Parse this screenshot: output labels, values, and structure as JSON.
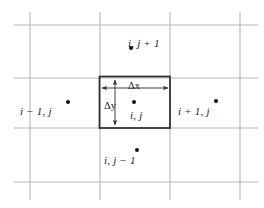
{
  "figure": {
    "background_color": "#ffffff",
    "grid_color": "#b4b4b4",
    "box_color": "#2b2b2b",
    "text_color": "#1a1a1a",
    "grid": {
      "vertical_lines_x": [
        30,
        100,
        170,
        240
      ],
      "horizontal_lines_y": [
        25,
        78,
        128,
        182
      ]
    },
    "control_volume": {
      "left": 99,
      "top": 76,
      "right": 170,
      "bottom": 128
    }
  },
  "labels": {
    "north": "i, j + 1",
    "west": "i − 1, j",
    "center": "i, j",
    "east": "i + 1, j",
    "south": "i, j − 1",
    "delta_x": "Δx",
    "delta_y": "Δy"
  },
  "label_parts": {
    "north_i": "i",
    "north_rest": ", j + 1",
    "west_i": "i",
    "west_rest": " − 1, ",
    "west_j": "j",
    "center_i": "i",
    "center_rest": ", ",
    "center_j": "j",
    "east_i": "i",
    "east_rest": " + 1, ",
    "east_j": "j",
    "south_i": "i",
    "south_rest": ", j − ",
    "south_one": "1",
    "delta_symbol": "Δ",
    "x_symbol": "x",
    "y_symbol": "y"
  },
  "nodes": [
    {
      "name": "north-node",
      "label": "i, j + 1",
      "dot_x": 129,
      "dot_y": 46
    },
    {
      "name": "west-node",
      "label": "i − 1, j",
      "dot_x": 66,
      "dot_y": 100
    },
    {
      "name": "center-node",
      "label": "i, j",
      "dot_x": 132,
      "dot_y": 100
    },
    {
      "name": "east-node",
      "label": "i + 1, j",
      "dot_x": 214,
      "dot_y": 99
    },
    {
      "name": "south-node",
      "label": "i, j − 1",
      "dot_x": 135,
      "dot_y": 148
    }
  ],
  "dimensions": [
    {
      "name": "delta-x",
      "label": "Δx",
      "orientation": "horizontal",
      "from": 99,
      "to": 170,
      "at": 88
    },
    {
      "name": "delta-y",
      "label": "Δy",
      "orientation": "vertical",
      "from": 78,
      "to": 127,
      "at": 115
    }
  ]
}
